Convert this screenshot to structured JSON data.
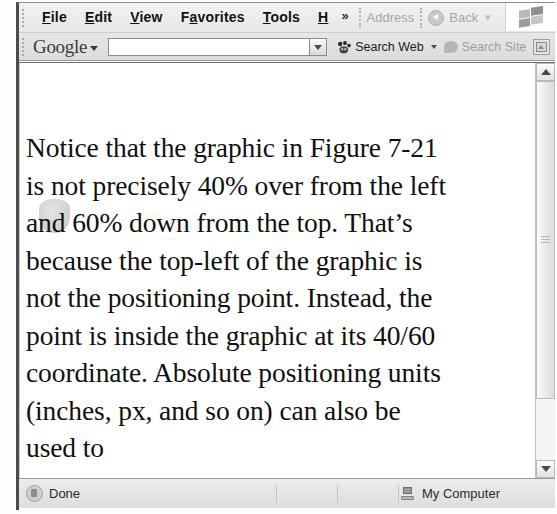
{
  "window": {
    "title": "Internet Explorer document window"
  },
  "menubar": {
    "items": [
      {
        "name": "file",
        "label": "File",
        "accel": "F"
      },
      {
        "name": "edit",
        "label": "Edit",
        "accel": "E"
      },
      {
        "name": "view",
        "label": "View",
        "accel": "V"
      },
      {
        "name": "favorites",
        "label": "Favorites",
        "accel": "a"
      },
      {
        "name": "tools",
        "label": "Tools",
        "accel": "T"
      },
      {
        "name": "help",
        "label": "H",
        "accel": "H"
      }
    ],
    "overflow_label": "»"
  },
  "addressbar": {
    "address_label": "Address",
    "back_label": "Back",
    "back_caret": "▾",
    "overflow_label": "»",
    "logo_icon": "windows-flag-icon"
  },
  "google_toolbar": {
    "logo_text": "Google",
    "logo_caret_icon": "chevron-down-icon",
    "search_value": "",
    "search_placeholder": "",
    "dropdown_icon": "chevron-down-icon",
    "search_web_label": "Search Web",
    "search_web_icon": "google-paw-icon",
    "search_web_caret_icon": "chevron-down-icon",
    "search_site_label": "Search Site",
    "search_site_icon": "speech-bubble-icon",
    "popup_blocker_icon": "popup-blocker-icon"
  },
  "document": {
    "paragraph": "Notice that the graphic in Figure 7-21 is not precisely 40% over from the left and 60% down from the top. That’s because the top-left of the graphic is not the positioning point. Instead, the point is inside the graphic at its 40/60 coordinate. Absolute positioning units (inches, px, and so on) can also be used to",
    "lines": [
      "Notice that the graphic in Figure 7-",
      "21 is not precisely 40% over from",
      "the left and 60% down from the top.",
      "That’s because the top-left of the",
      "graphic is not the positioning point.",
      "Instead, the point is inside the",
      "graphic at its 40/60 coordinate.",
      "Absolute positioning units (inches,",
      "px, and so on) can also be used to"
    ],
    "inline_graphic": "grey-shield-graphic"
  },
  "scrollbar": {
    "up_icon": "chevron-up-icon",
    "down_icon": "chevron-down-icon",
    "thumb": "scrollbar-thumb"
  },
  "statusbar": {
    "status_text": "Done",
    "status_icon": "document-icon",
    "zone_text": "My Computer",
    "zone_icon": "my-computer-icon"
  },
  "colors": {
    "toolbar_bg": "#e9e9e9",
    "content_bg": "#ffffff",
    "text": "#101010",
    "dimmed_text": "#a6a6a6",
    "frame_border": "#4c4c4c"
  }
}
